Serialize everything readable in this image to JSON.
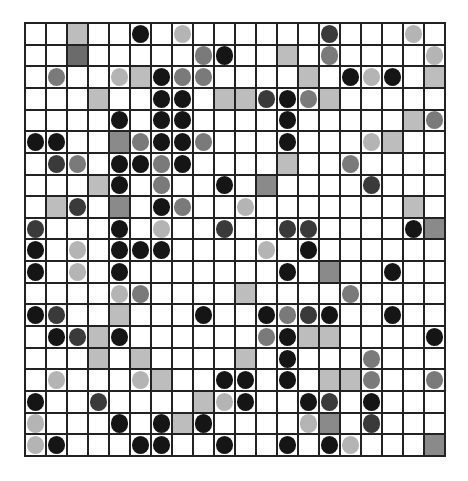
{
  "board": {
    "rows": 20,
    "cols": 20,
    "legend": {
      ".": "empty",
      "L": "light-gray-square",
      "M": "mid-gray-square",
      "D": "dark-gray-square",
      "b": "black-circle",
      "d": "dark-gray-circle",
      "m": "mid-gray-circle",
      "l": "light-gray-circle"
    },
    "colors": {
      "grid_line": "#222222",
      "empty": "#ffffff",
      "square_light": "#bdbdbd",
      "square_mid": "#8a8a8a",
      "square_dark": "#6b6b6b",
      "circle_black": "#151515",
      "circle_dark": "#3a3a3a",
      "circle_mid": "#7a7a7a",
      "circle_light": "#b4b4b4"
    },
    "grid": [
      "..L..b.l......d...l.",
      "..D.....mb..L.m....l",
      ".m..lLbmm....L.blb.L",
      "...L..bb.LLdbmL.....",
      "....b.bb....b.....Lm",
      "bb..Mmbbm...b...lL..",
      ".dm.bbmb....L..m....",
      "...Lb.m..b.M....d...",
      ".Ld.M.bm..l.......L.",
      "d...b.l..d..dd....bM",
      "b.l.bbb....l.b......",
      "b.l.b.......b.M..b..",
      "....lm....L....m....",
      "bd..L...b..bmdb..b..",
      ".bdLb......mbLL....b",
      "...L.L....L.b...m...",
      ".l...lL..bb.b.LLm..m",
      "b..d....Llb..bd.b...",
      "l...b.bLb....lM.d...",
      "lb...bb..b..b.bl...M"
    ]
  }
}
